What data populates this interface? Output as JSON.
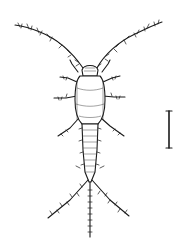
{
  "figure": {
    "style": "black ink scientific illustration on white",
    "has_text": false,
    "scale_bar": {
      "orientation": "vertical",
      "label": ""
    },
    "colors": {
      "ink": "#1a1a1a",
      "background": "#ffffff"
    }
  }
}
